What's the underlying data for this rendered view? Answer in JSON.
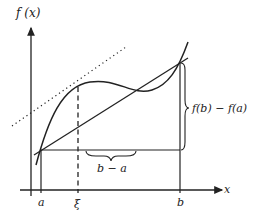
{
  "diagram": {
    "y_axis_label": "f (x)",
    "x_axis_label": "x",
    "point_labels": {
      "a": "a",
      "xi": "ξ",
      "b": "b"
    },
    "brace_labels": {
      "horizontal": "b − a",
      "vertical": "f(b) − f(a)"
    },
    "elements": [
      "curve f(x)",
      "secant line through (a,f(a)) and (b,f(b))",
      "dotted tangent line at ξ parallel to secant",
      "dashed vertical line at ξ",
      "horizontal brace for b − a",
      "vertical brace for f(b) − f(a)"
    ],
    "colors": {
      "ink": "#222222",
      "background": "#ffffff"
    }
  }
}
